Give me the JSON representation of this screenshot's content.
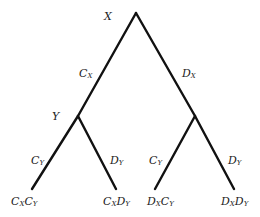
{
  "diagram": {
    "type": "binary-tree",
    "nodes": {
      "root": {
        "label": "X"
      },
      "left": {
        "label": "Y"
      }
    },
    "edges": {
      "root_left": {
        "main": "C",
        "sub": "X"
      },
      "root_right": {
        "main": "D",
        "sub": "X"
      },
      "left_left": {
        "main": "C",
        "sub": "Y"
      },
      "left_right": {
        "main": "D",
        "sub": "Y"
      },
      "right_left": {
        "main": "C",
        "sub": "Y"
      },
      "right_right": {
        "main": "D",
        "sub": "Y"
      }
    },
    "leaves": [
      {
        "a": "C",
        "a_sub": "X",
        "b": "C",
        "b_sub": "Y"
      },
      {
        "a": "C",
        "a_sub": "X",
        "b": "D",
        "b_sub": "Y"
      },
      {
        "a": "D",
        "a_sub": "X",
        "b": "C",
        "b_sub": "Y"
      },
      {
        "a": "D",
        "a_sub": "X",
        "b": "D",
        "b_sub": "Y"
      }
    ],
    "colors": {
      "line": "#111111",
      "text": "#222222",
      "background": "#ffffff"
    }
  }
}
